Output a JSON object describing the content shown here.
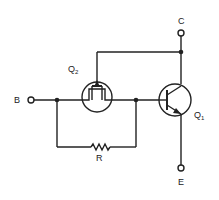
{
  "diagram": {
    "type": "circuit-schematic",
    "terminals": {
      "base": "B",
      "collector": "C",
      "emitter": "E"
    },
    "components": {
      "mosfet": {
        "label": "Q",
        "subscript": "2"
      },
      "bjt": {
        "label": "Q",
        "subscript": "1"
      },
      "resistor": {
        "label": "R"
      }
    },
    "colors": {
      "line": "#222222",
      "background": "#ffffff"
    }
  }
}
